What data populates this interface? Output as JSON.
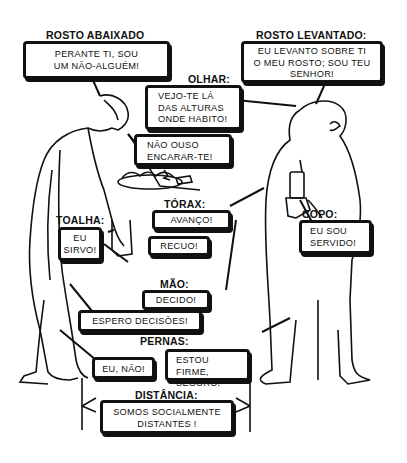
{
  "labels": {
    "rosto_abaixado": "ROSTO ABAIXADO",
    "rosto_levantado": "ROSTO LEVANTADO:",
    "olhar": "OLHAR:",
    "torax": "TÓRAX:",
    "toalha": "TOALHA:",
    "copo": "COPO:",
    "mao": "MÃO:",
    "pernas": "PERNAS:",
    "distancia": "DISTÂNCIA:"
  },
  "bubbles": {
    "rosto_abaixado": "PERANTE TI, SOU\nUM NÃO-ALGUÉM!",
    "rosto_levantado": "EU LEVANTO SOBRE TI\nO MEU ROSTO; SOU TEU\nSENHOR!",
    "olhar": "VEJO-TE LÁ\nDAS ALTURAS\nONDE HABITO!",
    "encarar": "NÃO OUSO\nENCARAR-TE!",
    "torax_avanco": "AVANÇO!",
    "toalha": "EU\nSIRVO!",
    "recuo": "RECUO!",
    "copo": "EU SOU\nSERVIDO!",
    "mao_decido": "DECIDO!",
    "espero": "ESPERO DECISÕES!",
    "pernas_eu_nao": "EU, NÃO!",
    "pernas_firme": "ESTOU FIRME,\nSEGURO!",
    "distancia": "SOMOS SOCIALMENTE\nDISTANTES !"
  },
  "colors": {
    "ink": "#111111",
    "paper": "#ffffff"
  }
}
